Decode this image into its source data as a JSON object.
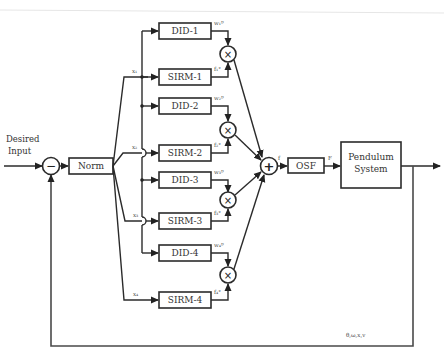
{
  "diagram": {
    "input_label_line1": "Desired",
    "input_label_line2": "Input",
    "summing_junction_sign": "−",
    "norm_label": "Norm",
    "did_blocks": [
      "DID-1",
      "DID-2",
      "DID-3",
      "DID-4"
    ],
    "sirm_blocks": [
      "SIRM-1",
      "SIRM-2",
      "SIRM-3",
      "SIRM-4"
    ],
    "input_signals": [
      "x₁",
      "x₂",
      "x₃",
      "x₄"
    ],
    "weights": [
      "w₁ᴰ",
      "w₂ᴰ",
      "w₃ᴰ",
      "w₄ᴰ"
    ],
    "sirm_outputs": [
      "f₁°",
      "f₂°",
      "f₃°",
      "f₄°"
    ],
    "multiply_sign": "×",
    "sum_sign": "+",
    "sum_output_label": "f",
    "osf_label": "OSF",
    "osf_output_label": "F",
    "plant_label_line1": "Pendulum",
    "plant_label_line2": "System",
    "feedback_label": "θ,ω,x,v"
  }
}
